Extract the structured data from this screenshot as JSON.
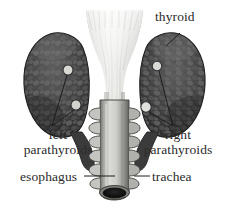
{
  "figure": {
    "style": "grayscale medical illustration",
    "background_color": "#ffffff",
    "label_color": "#2b2b2b",
    "leader_line_color": "#1e1e1e"
  },
  "labels": {
    "thyroid": "thyroid",
    "left_parathyroids_line1": "left",
    "left_parathyroids_line2": "parathyroids",
    "right_parathyroids_line1": "right",
    "right_parathyroids_line2": "parathyroids",
    "esophagus": "esophagus",
    "trachea": "trachea"
  },
  "structures": {
    "left_lobe": "left-thyroid-lobe",
    "right_lobe": "right-thyroid-lobe",
    "larynx": "larynx-cartilage-funnel",
    "trachea_tube": "trachea-tube",
    "trachea_lumen": "trachea-lumen-opening",
    "parathyroid_count": 4
  },
  "colors": {
    "lobe_dark": "#3a3a3a",
    "lobe_mid": "#5c5c5c",
    "lobe_light": "#8d8d8d",
    "larynx_light": "#e8e8e6",
    "larynx_mid": "#c3c3c0",
    "larynx_shadow": "#9a9a97",
    "trachea_light": "#d6d6d3",
    "trachea_mid": "#a9a9a6",
    "trachea_dark": "#6e6e6b",
    "lumen": "#141414",
    "parathyroid_fill": "#d8d8d4",
    "parathyroid_stroke": "#3c3c3c"
  }
}
